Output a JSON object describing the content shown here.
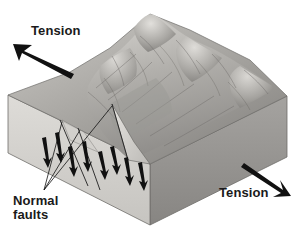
{
  "figure": {
    "type": "block-diagram",
    "background_color": "#ffffff"
  },
  "labels": {
    "tension_left": "Tension",
    "tension_right": "Tension",
    "normal_faults_line1": "Normal",
    "normal_faults_line2": "faults"
  },
  "colors": {
    "arrow": "#111111",
    "fault_line": "#111111",
    "text": "#1a1a1a",
    "front_face_light": "#d8d6d2",
    "front_face_mid": "#c3c1bd",
    "right_face_dark": "#8d8b88",
    "terrain_light": "#cfcdc9",
    "terrain_mid": "#a9a7a3",
    "terrain_dark": "#7e7c79",
    "outline": "#6f6d6a"
  },
  "annotations": {
    "tension_left_arrow": "arrow pointing up-left",
    "tension_right_arrow": "arrow pointing down-right",
    "leader_lines": 3,
    "fault_slip_arrow_pairs": 4
  }
}
